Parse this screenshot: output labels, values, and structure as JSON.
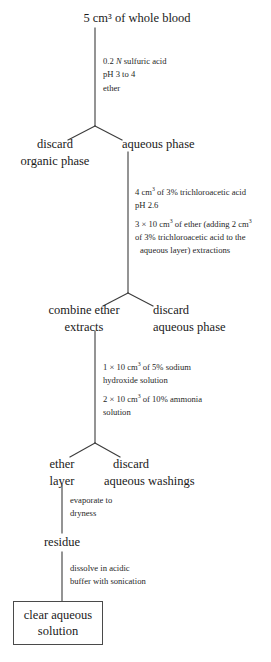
{
  "diagram": {
    "line_color": "#3c3c3c",
    "text_color": "#1a1a1a",
    "background": "#ffffff",
    "nodes": {
      "start": "5 cm³ of whole blood",
      "discard_organic_line1": "discard",
      "discard_organic_line2": "organic phase",
      "aqueous_phase": "aqueous phase",
      "combine_ether_line1": "combine ether",
      "combine_ether_line2": "extracts",
      "discard_aqueous_phase_line1": "discard",
      "discard_aqueous_phase_line2": "aqueous phase",
      "ether_layer_line1": "ether",
      "ether_layer_line2": "layer",
      "discard_washings_line1": "discard",
      "discard_washings_line2": "aqueous washings",
      "residue": "residue",
      "final_line1": "clear aqueous",
      "final_line2": "solution"
    },
    "steps": {
      "step1": {
        "line1_a": "0.2 ",
        "line1_italic": "N",
        "line1_b": " sulfuric acid",
        "line2": "pH 3 to 4",
        "line3": "ether"
      },
      "step2": {
        "line1_a": "4 cm",
        "line1_sup": "3",
        "line1_b": " of 3% trichloroacetic acid",
        "line2": "pH 2.6",
        "line3_a": "3 × 10 cm",
        "line3_sup1": "3",
        "line3_b": " of ether (adding 2 cm",
        "line3_sup2": "3",
        "line4": "of 3% trichloroacetic acid to the",
        "line5": "aqueous layer) extractions"
      },
      "step3": {
        "line1_a": "1 × 10 cm",
        "line1_sup": "3",
        "line1_b": " of 5% sodium",
        "line2": "hydroxide solution",
        "line3_a": "2 × 10 cm",
        "line3_sup": "3",
        "line3_b": " of 10% ammonia",
        "line4": "solution"
      },
      "step4": {
        "line1": "evaporate to",
        "line2": "dryness"
      },
      "step5": {
        "line1": "dissolve in acidic",
        "line2": "buffer with sonication"
      }
    }
  }
}
